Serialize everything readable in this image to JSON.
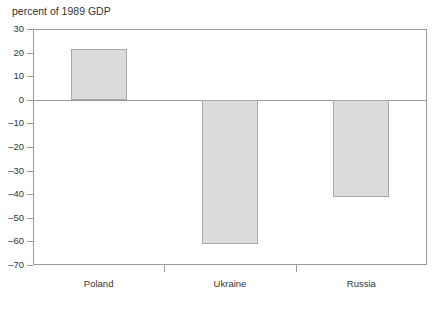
{
  "chart_data": {
    "type": "bar",
    "title": "percent of 1989 GDP",
    "xlabel": "",
    "ylabel": "percent of 1989 GDP",
    "categories": [
      "Poland",
      "Ukraine",
      "Russia"
    ],
    "values": [
      21.5,
      -61,
      -41
    ],
    "ylim": [
      -70,
      30
    ],
    "yticks": [
      30,
      20,
      10,
      0,
      -10,
      -20,
      -30,
      -40,
      -50,
      -60,
      -70
    ],
    "ytick_labels": [
      "30",
      "20",
      "10",
      "0",
      "–10",
      "–20",
      "–30",
      "–40",
      "–50",
      "–60",
      "–70"
    ],
    "grid": false,
    "legend": null,
    "zero_line": 0,
    "series": [
      {
        "name": "percent of 1989 GDP",
        "values": [
          21.5,
          -61,
          -41
        ]
      }
    ],
    "colors": {
      "bar_fill": "#dcdcdc",
      "bar_border": "#a9a9a9",
      "axis": "#9a9a9a",
      "text": "#333333",
      "background": "#ffffff"
    }
  }
}
